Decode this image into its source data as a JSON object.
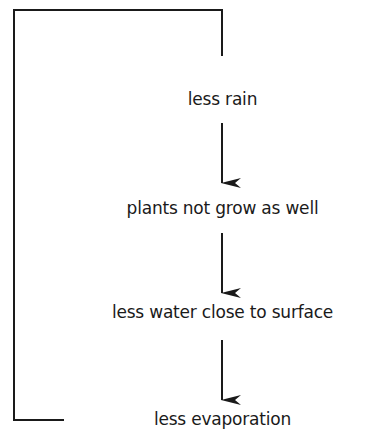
{
  "diagram": {
    "type": "feedback-loop flowchart",
    "nodes": [
      {
        "id": "n1",
        "label": "less rain"
      },
      {
        "id": "n2",
        "label": "plants not grow as well"
      },
      {
        "id": "n3",
        "label": "less water close to surface"
      },
      {
        "id": "n4",
        "label": "less evaporation"
      }
    ],
    "edges": [
      {
        "from": "n1",
        "to": "n2"
      },
      {
        "from": "n2",
        "to": "n3"
      },
      {
        "from": "n3",
        "to": "n4"
      },
      {
        "from": "n4",
        "to": "n1",
        "style": "loop line (left side, back to top)"
      }
    ],
    "colors": {
      "line": "#1a1a1a",
      "background": "#ffffff"
    }
  }
}
